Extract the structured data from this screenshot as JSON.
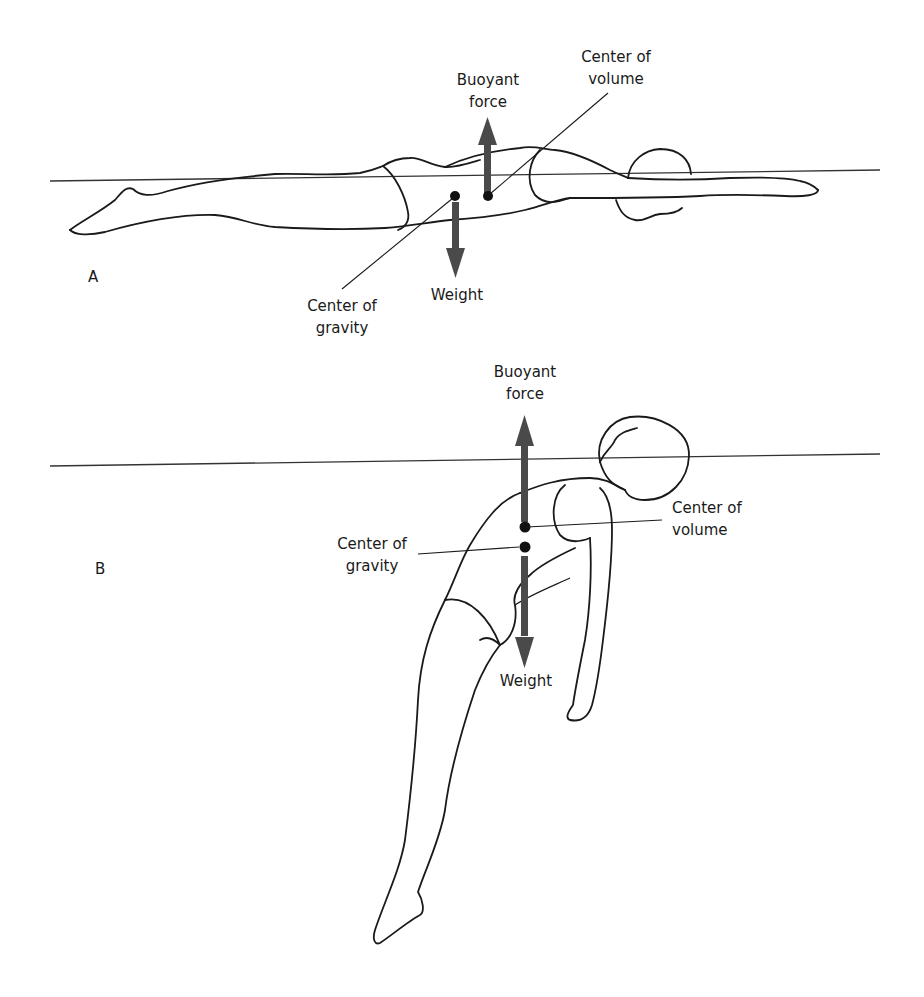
{
  "figure": {
    "colors": {
      "arrow": "#4a4a4a",
      "outline": "#1a1a1a",
      "dot": "#111111",
      "background": "#ffffff"
    },
    "panel_a": {
      "letter": "A",
      "buoyant_force_label_line1": "Buoyant",
      "buoyant_force_label_line2": "force",
      "center_of_volume_label_line1": "Center of",
      "center_of_volume_label_line2": "volume",
      "weight_label": "Weight",
      "center_of_gravity_label_line1": "Center of",
      "center_of_gravity_label_line2": "gravity",
      "pose": "prone horizontal swimmer, arms extended forward"
    },
    "panel_b": {
      "letter": "B",
      "buoyant_force_label_line1": "Buoyant",
      "buoyant_force_label_line2": "force",
      "center_of_volume_label_line1": "Center of",
      "center_of_volume_label_line2": "volume",
      "weight_label": "Weight",
      "center_of_gravity_label_line1": "Center of",
      "center_of_gravity_label_line2": "gravity",
      "pose": "supine swimmer, legs sinking diagonally"
    }
  }
}
